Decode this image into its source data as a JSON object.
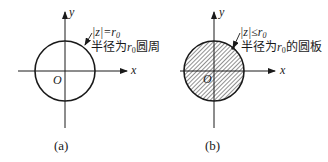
{
  "panels": [
    {
      "id": "a",
      "caption": "(a)",
      "axis_x_label": "x",
      "axis_y_label": "y",
      "origin_label": "O",
      "formula_left": "|z|=r",
      "formula_sub": "0",
      "desc_pre": "半径为",
      "desc_var": "r",
      "desc_sub": "0",
      "desc_post": "圆周",
      "fill": "none"
    },
    {
      "id": "b",
      "caption": "(b)",
      "axis_x_label": "x",
      "axis_y_label": "y",
      "origin_label": "O",
      "formula_left": "|z|≤r",
      "formula_sub": "0",
      "desc_pre": "半径为",
      "desc_var": "r",
      "desc_sub": "0",
      "desc_post": "的圆板",
      "fill": "hatched"
    }
  ],
  "colors": {
    "stroke": "#1a1a1a",
    "background": "#ffffff"
  }
}
